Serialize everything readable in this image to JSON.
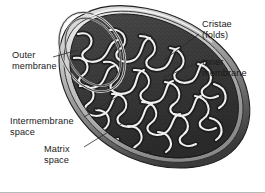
{
  "figure": {
    "background_color": "#ffffff",
    "border_color": "#b9b9b9",
    "palette": {
      "matrix_dark": "#3d3d3d",
      "matrix_darker": "#2a2a2a",
      "cristae_light": "#f2f2f2",
      "cristae_mid": "#9a9a9a",
      "outer_surface_light": "#d8d8d8",
      "outer_surface_mid": "#8f8f8f",
      "outer_surface_dark": "#4a4a4a",
      "outline": "#1f1f1f",
      "leader_line": "#2b2b2b",
      "label_text": "#1a1a1a"
    }
  },
  "labels": [
    {
      "id": "outer-membrane",
      "lines": [
        "Outer",
        "membrane"
      ],
      "x": 12,
      "y": 58,
      "anchor": "start",
      "leader": "M 53 57 L 78 50"
    },
    {
      "id": "cristae-folds",
      "lines": [
        "Cristae",
        "(folds)"
      ],
      "x": 202,
      "y": 27,
      "anchor": "start",
      "leader": "M 199 34 L 164 60"
    },
    {
      "id": "inner-membrane",
      "lines": [
        "Inner",
        "membrane"
      ],
      "x": 202,
      "y": 65,
      "anchor": "start",
      "leader": "M 199 62 L 163 78"
    },
    {
      "id": "intermembrane-space",
      "lines": [
        "Intermembrane",
        "space"
      ],
      "x": 10,
      "y": 124,
      "anchor": "start",
      "leader": "M 84 117 L 117 97"
    },
    {
      "id": "matrix-space",
      "lines": [
        "Matrix",
        "space"
      ],
      "x": 44,
      "y": 152,
      "anchor": "start",
      "leader": "M 84 147 L 131 118"
    }
  ],
  "structures": {
    "outer_membrane_label": "Outer membrane",
    "inner_membrane_label": "Inner membrane",
    "cristae_label": "Cristae (folds)",
    "intermembrane_space_label": "Intermembrane space",
    "matrix_space_label": "Matrix space"
  }
}
